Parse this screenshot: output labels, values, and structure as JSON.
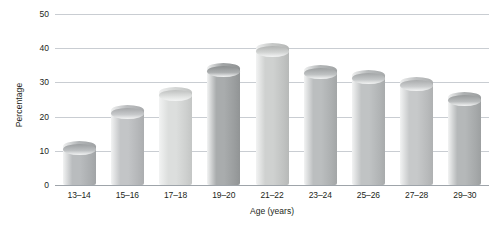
{
  "chart_data": {
    "type": "bar",
    "title": "",
    "xlabel": "Age (years)",
    "ylabel": "Percentage",
    "categories": [
      "13–14",
      "15–16",
      "17–18",
      "19–20",
      "21–22",
      "23–24",
      "25–26",
      "27–28",
      "29–30"
    ],
    "values": [
      11.3,
      21.8,
      27,
      34,
      40,
      33.6,
      32,
      30,
      25.5
    ],
    "ylim": [
      0,
      50
    ],
    "yticks": [
      "0",
      "10",
      "20",
      "30",
      "40",
      "50"
    ],
    "ytick_values": [
      0,
      10,
      20,
      30,
      40,
      50
    ],
    "grid": true,
    "legend": "none",
    "bar_style": "3d-cylinder",
    "bar_colors": [
      "#b9bcbe",
      "#c3c5c7",
      "#dcdedd",
      "#a9acad",
      "#cfd1d0",
      "#bbbebf",
      "#c0c3c4",
      "#c7c9ca",
      "#b5b8b9"
    ]
  }
}
